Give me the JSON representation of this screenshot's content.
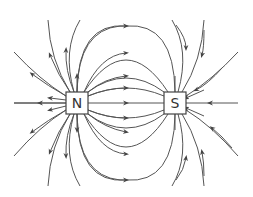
{
  "diagram": {
    "north_pole": {
      "label": "N",
      "center": [
        77,
        103
      ]
    },
    "south_pole": {
      "label": "S",
      "center": [
        175,
        103
      ]
    },
    "line_color": "#555555",
    "arrow_direction": "from N to S"
  }
}
